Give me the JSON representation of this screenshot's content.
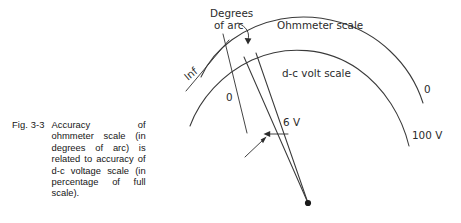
{
  "figure": {
    "caption_label": "Fig. 3-3",
    "caption_text": "Accuracy of ohmmeter scale (in degrees of arc) is related to accuracy of d-c voltage scale (in percentage of full scale).",
    "line_color": "#3a3a3a",
    "text_color": "#2b2b2b",
    "background": "#ffffff"
  },
  "diagram": {
    "labels": {
      "degrees_of_arc_line1": "Degrees",
      "degrees_of_arc_line2": "of arc",
      "ohmmeter_scale": "Ohmmeter scale",
      "dc_volt_scale": "d-c volt scale",
      "ohm_infinity": "Inf",
      "ohm_zero": "0",
      "volt_zero": "0",
      "volt_full_scale": "100 V",
      "pointer_gap": "6 V"
    },
    "scales": [
      {
        "name": "ohmmeter-scale",
        "label": "Ohmmeter scale",
        "low_end_label": "Inf",
        "high_end_label": "0",
        "radius": 205
      },
      {
        "name": "dc-volt-scale",
        "label": "d-c volt scale",
        "low_end_label": "0",
        "high_end_label": "100 V",
        "radius": 168
      }
    ],
    "pivot": {
      "x": 308,
      "y": 203
    },
    "pointers": [
      {
        "name": "pointer-left",
        "value_label": "6 V"
      },
      {
        "name": "pointer-right",
        "value_label": "6 V"
      }
    ],
    "radial_ticks": 2,
    "annotation_arrows": 3
  }
}
